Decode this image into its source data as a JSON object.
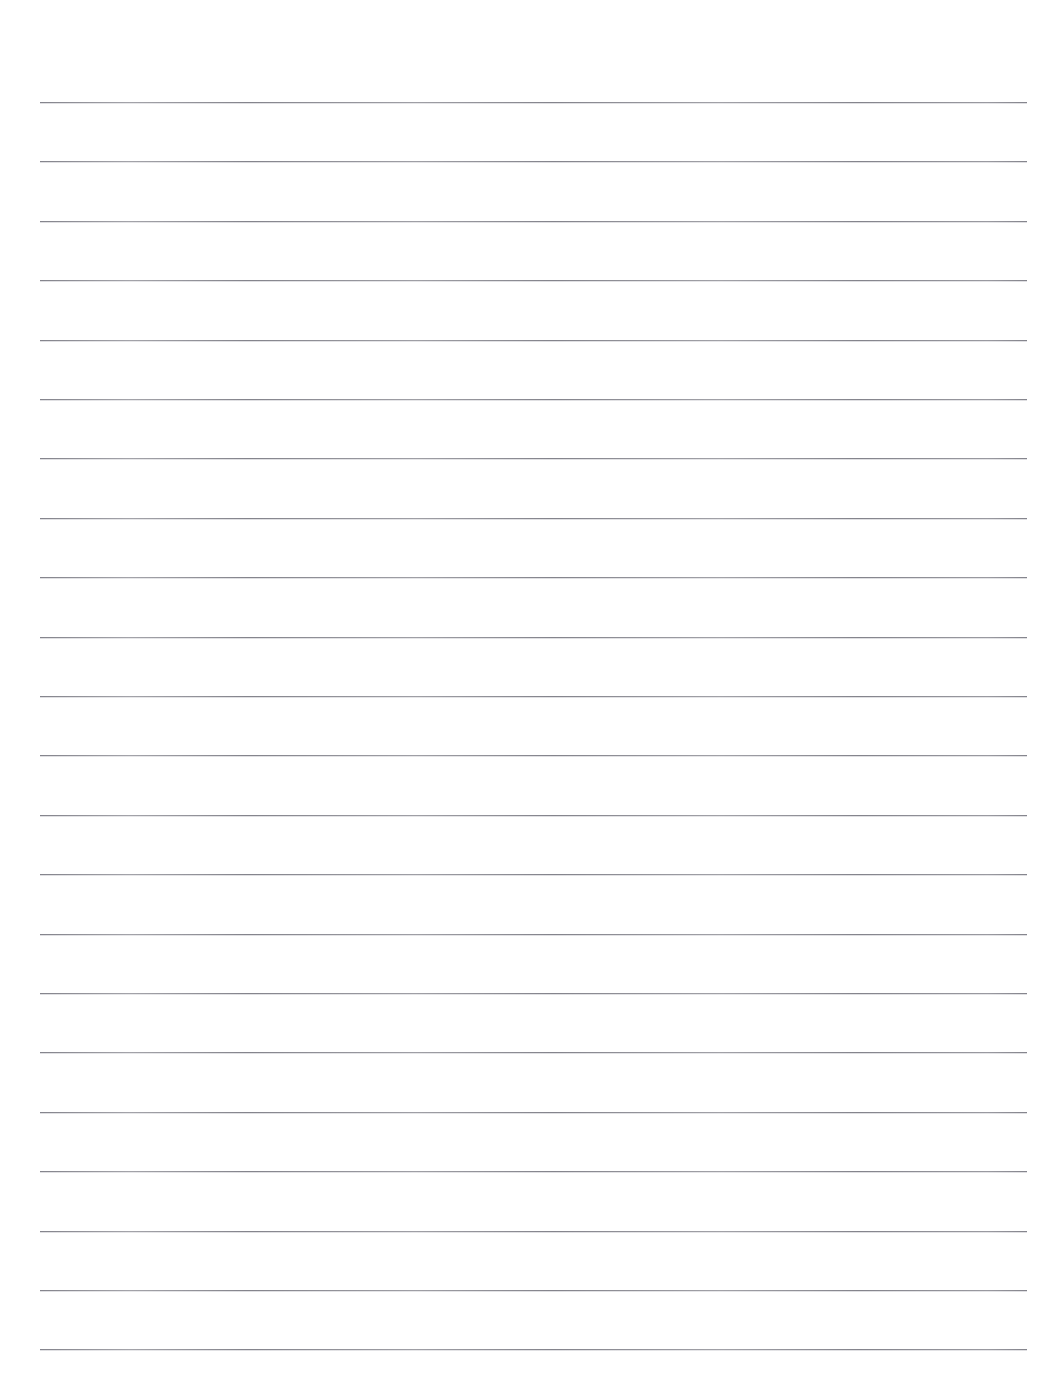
{
  "document": {
    "kind": "lined-writing-paper",
    "title": "",
    "page_width": 1050,
    "page_height": 1394,
    "background_color": "#ffffff",
    "has_text_content": false,
    "header_text": "",
    "footer_text": "",
    "page_number": ""
  },
  "ruling": {
    "line_color": "#84848c",
    "line_thickness_px": 1,
    "line_count": 22,
    "first_line_y": 102,
    "line_spacing_px": 59.4,
    "left_margin_x": 40,
    "right_margin_x": 1027,
    "line_length_px": 987,
    "has_vertical_margin_rule": false,
    "margin_rule_color": ""
  },
  "lines": [
    {
      "index": 1,
      "y": 102,
      "text": ""
    },
    {
      "index": 2,
      "y": 161.4,
      "text": ""
    },
    {
      "index": 3,
      "y": 220.8,
      "text": ""
    },
    {
      "index": 4,
      "y": 280.2,
      "text": ""
    },
    {
      "index": 5,
      "y": 339.6,
      "text": ""
    },
    {
      "index": 6,
      "y": 399.0,
      "text": ""
    },
    {
      "index": 7,
      "y": 458.4,
      "text": ""
    },
    {
      "index": 8,
      "y": 517.8,
      "text": ""
    },
    {
      "index": 9,
      "y": 577.2,
      "text": ""
    },
    {
      "index": 10,
      "y": 636.6,
      "text": ""
    },
    {
      "index": 11,
      "y": 696.0,
      "text": ""
    },
    {
      "index": 12,
      "y": 755.4,
      "text": ""
    },
    {
      "index": 13,
      "y": 814.8,
      "text": ""
    },
    {
      "index": 14,
      "y": 874.2,
      "text": ""
    },
    {
      "index": 15,
      "y": 933.6,
      "text": ""
    },
    {
      "index": 16,
      "y": 993.0,
      "text": ""
    },
    {
      "index": 17,
      "y": 1052.4,
      "text": ""
    },
    {
      "index": 18,
      "y": 1111.8,
      "text": ""
    },
    {
      "index": 19,
      "y": 1171.2,
      "text": ""
    },
    {
      "index": 20,
      "y": 1230.6,
      "text": ""
    },
    {
      "index": 21,
      "y": 1290.0,
      "text": ""
    },
    {
      "index": 22,
      "y": 1349.4,
      "text": ""
    }
  ]
}
